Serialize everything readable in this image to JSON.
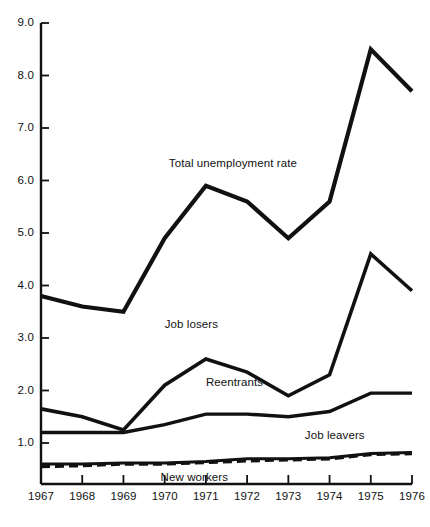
{
  "chart_data": {
    "type": "line",
    "title": "",
    "xlabel": "",
    "ylabel": "",
    "x": [
      1967,
      1968,
      1969,
      1970,
      1971,
      1972,
      1973,
      1974,
      1975,
      1976
    ],
    "xtick_labels": [
      "1967",
      "1968",
      "1969",
      "1970",
      "1971",
      "1972",
      "1973",
      "1974",
      "1975",
      "1976"
    ],
    "xlim": [
      1967,
      1976
    ],
    "ylim": [
      0,
      9.0
    ],
    "ytick_labels": [
      "1.0",
      "2.0",
      "3.0",
      "4.0",
      "5.0",
      "6.0",
      "7.0",
      "8.0",
      "9.0"
    ],
    "yticks": [
      1.0,
      2.0,
      3.0,
      4.0,
      5.0,
      6.0,
      7.0,
      8.0,
      9.0
    ],
    "grid": false,
    "legend_position": "inline-annotations",
    "series": [
      {
        "name": "Total unemployment rate",
        "style": "solid",
        "values": [
          3.8,
          3.6,
          3.5,
          4.9,
          5.9,
          5.6,
          4.9,
          5.6,
          8.5,
          7.7
        ]
      },
      {
        "name": "Job losers",
        "style": "solid",
        "values": [
          1.65,
          1.5,
          1.25,
          2.1,
          2.6,
          2.35,
          1.9,
          2.3,
          4.6,
          3.9
        ]
      },
      {
        "name": "Reentrants",
        "style": "solid",
        "values": [
          1.2,
          1.2,
          1.2,
          1.35,
          1.55,
          1.55,
          1.5,
          1.6,
          1.95,
          1.95
        ]
      },
      {
        "name": "Job leavers",
        "style": "solid",
        "values": [
          0.6,
          0.6,
          0.62,
          0.62,
          0.65,
          0.7,
          0.7,
          0.72,
          0.8,
          0.82
        ]
      },
      {
        "name": "New workers",
        "style": "dashed",
        "values": [
          0.55,
          0.57,
          0.6,
          0.6,
          0.63,
          0.66,
          0.68,
          0.7,
          0.78,
          0.8
        ]
      }
    ],
    "annotations": [
      {
        "text": "Total unemployment rate",
        "x": 1970.1,
        "y": 6.3
      },
      {
        "text": "Job losers",
        "x": 1970.0,
        "y": 3.22
      },
      {
        "text": "Reentrants",
        "x": 1971.0,
        "y": 2.12
      },
      {
        "text": "Job leavers",
        "x": 1973.4,
        "y": 1.12
      },
      {
        "text": "New workers",
        "x": 1969.9,
        "y": 0.31
      }
    ],
    "colors": {
      "line": "#111111",
      "axis": "#111111",
      "background": "#ffffff"
    }
  }
}
